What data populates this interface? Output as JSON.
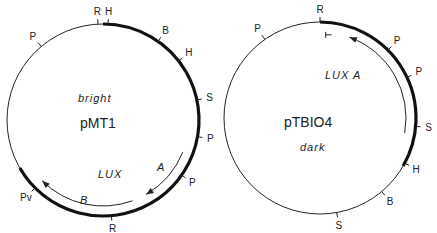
{
  "plasmids": [
    {
      "name": "pMT1",
      "phenotype": "bright",
      "gene_label": "LUX",
      "gene_sub_labels": [
        "A",
        "B"
      ],
      "sites": [
        {
          "label": "R",
          "angle": -3
        },
        {
          "label": "H",
          "angle": 3
        },
        {
          "label": "B",
          "angle": 35
        },
        {
          "label": "H",
          "angle": 52
        },
        {
          "label": "S",
          "angle": 78
        },
        {
          "label": "P",
          "angle": 100
        },
        {
          "label": "P",
          "angle": 125
        },
        {
          "label": "R",
          "angle": 175
        },
        {
          "label": "Pv",
          "angle": 225
        },
        {
          "label": "P",
          "angle": 320
        }
      ],
      "thick_arcs": [
        [
          0,
          60
        ],
        [
          60,
          240
        ]
      ],
      "gene_arcs": [
        {
          "from": 112,
          "to": 150,
          "sub": "A"
        },
        {
          "from": 160,
          "to": 225,
          "sub": "B"
        }
      ]
    },
    {
      "name": "pTBIO4",
      "phenotype": "dark",
      "gene_label": "LUX  A",
      "sites": [
        {
          "label": "R",
          "angle": 0
        },
        {
          "label": "P",
          "angle": 45
        },
        {
          "label": "P",
          "angle": 65
        },
        {
          "label": "S",
          "angle": 95
        },
        {
          "label": "H",
          "angle": 118
        },
        {
          "label": "B",
          "angle": 140
        },
        {
          "label": "S",
          "angle": 170
        },
        {
          "label": "P",
          "angle": 325
        }
      ],
      "thick_arcs": [
        [
          0,
          120
        ]
      ],
      "gene_arcs": [
        {
          "from": 20,
          "to": 100
        }
      ]
    }
  ]
}
